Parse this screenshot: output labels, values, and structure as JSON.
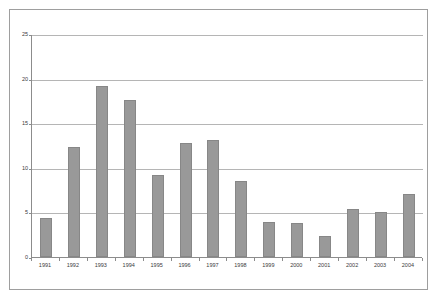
{
  "chart_data": {
    "type": "bar",
    "title": "",
    "subtitle": "",
    "xlabel": "",
    "ylabel": "",
    "categories": [
      "1991",
      "1992",
      "1993",
      "1994",
      "1995",
      "1996",
      "1997",
      "1998",
      "1999",
      "2000",
      "2001",
      "2002",
      "2003",
      "2004"
    ],
    "values": [
      4.4,
      12.3,
      19.2,
      17.6,
      9.2,
      12.8,
      13.1,
      8.5,
      3.9,
      3.8,
      2.4,
      5.4,
      5.0,
      7.1
    ],
    "series": [
      {
        "name": "",
        "values": [
          4.4,
          12.3,
          19.2,
          17.6,
          9.2,
          12.8,
          13.1,
          8.5,
          3.9,
          3.8,
          2.4,
          5.4,
          5.0,
          7.1
        ]
      }
    ],
    "ylim": [
      0,
      25
    ],
    "yticks": [
      0,
      5,
      10,
      15,
      20,
      25
    ],
    "ytick_labels": [
      "0",
      "5",
      "10",
      "15",
      "20",
      "25"
    ],
    "grid": true,
    "grid_axis": "y",
    "legend": false,
    "legend_position": "none",
    "bar_color": "#999999",
    "bar_edge_color": "#878787",
    "gridline_color": "#b5b5b5",
    "axis_color": "#8c8c8c",
    "frame_color": "#9e9e9e",
    "background": "#ffffff"
  }
}
